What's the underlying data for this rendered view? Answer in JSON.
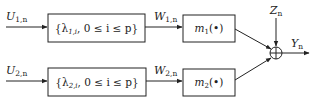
{
  "diagram": {
    "inputs": [
      {
        "var": "U",
        "sub": "1,n"
      },
      {
        "var": "U",
        "sub": "2,n"
      }
    ],
    "filters": [
      {
        "text": "{λ",
        "sub": "1,i",
        "rest": ", 0 ≤ i ≤ p}"
      },
      {
        "text": "{λ",
        "sub": "2,i",
        "rest": ", 0 ≤ i ≤ p}"
      }
    ],
    "intermediates": [
      {
        "var": "W",
        "sub": "1,n"
      },
      {
        "var": "W",
        "sub": "2,n"
      }
    ],
    "nonlinearities": [
      {
        "var": "m",
        "sub": "1",
        "arg": "(•)"
      },
      {
        "var": "m",
        "sub": "2",
        "arg": "(•)"
      }
    ],
    "noise": {
      "var": "Z",
      "sub": "n"
    },
    "output": {
      "var": "Y",
      "sub": "n"
    },
    "summer_symbol": "⊕",
    "line_color": "#222222"
  }
}
